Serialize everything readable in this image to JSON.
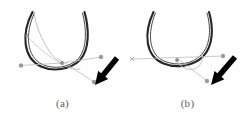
{
  "figure": {
    "background_color": "#fefefe",
    "panel_count": 2,
    "panels": [
      {
        "id": "a",
        "caption": "(a)",
        "curve_color": "#262626",
        "guide_color": "#b4b4b4",
        "arrow_color": "#000000",
        "marker_color": "#8c8c8c",
        "description": "U-shaped dark curve with crossing guide lines and a black annotation arrow pointing to a node marker"
      },
      {
        "id": "b",
        "caption": "(b)",
        "curve_color": "#262626",
        "guide_color": "#b4b4b4",
        "arrow_color": "#000000",
        "marker_color": "#8c8c8c",
        "description": "U-shaped dark curve with a horizontal guide line and a black annotation arrow pointing to a node marker"
      }
    ]
  },
  "chart_data": {
    "type": "line",
    "title": "",
    "xlabel": "",
    "ylabel": "",
    "grid": false,
    "legend": null,
    "xlim": [
      0,
      125
    ],
    "ylim": [
      0,
      100
    ],
    "panels": [
      {
        "name": "(a)",
        "series": [
          {
            "name": "u-curve-outer",
            "role": "dark-u-curve",
            "color": "#262626",
            "width": 2.1,
            "path": "M 32.5 12 C 21 34, 23 58, 41 66.5 C 53 72, 70 70, 80 60 C 90 49.5, 89 28, 84.5 12"
          },
          {
            "name": "u-curve-inner-highlight",
            "role": "dark-u-curve-inner",
            "color": "#4a4a4a",
            "width": 1.0,
            "path": "M 34.5 13 C 24.5 34, 26.5 57, 42.5 64.5 C 54 69.5, 69 68, 78.5 58.5 C 87.5 48.5, 86.5 28, 82.5 13"
          },
          {
            "name": "guide-arc",
            "role": "light-guide-arc",
            "color": "#b9b9b9",
            "width": 0.9,
            "path": "M 34 12 C 36 30, 48 55, 62 64 C 70 69, 76 70, 80 69"
          },
          {
            "name": "guide-arc-2",
            "role": "light-guide-arc",
            "color": "#c4c4c4",
            "width": 0.8,
            "path": "M 27 36 C 36 46, 50 58, 62 64"
          },
          {
            "name": "guide-line-left",
            "role": "light-guide-line",
            "color": "#bdbdbd",
            "width": 0.8,
            "x": [
              21,
              62
            ],
            "y": [
              65.5,
              63
            ]
          },
          {
            "name": "guide-line-right",
            "role": "light-guide-line",
            "color": "#bdbdbd",
            "width": 0.8,
            "x": [
              62,
              101
            ],
            "y": [
              63,
              57
            ]
          },
          {
            "name": "guide-line-diagonal",
            "role": "light-guide-line",
            "color": "#bdbdbd",
            "width": 0.8,
            "x": [
              57,
              94
            ],
            "y": [
              58,
              82
            ]
          }
        ],
        "markers": [
          {
            "name": "node-left",
            "x": 21,
            "y": 65.5,
            "r": 1.9,
            "color": "#9a9a9a"
          },
          {
            "name": "node-center",
            "x": 62,
            "y": 63,
            "r": 1.7,
            "color": "#8f8f8f"
          },
          {
            "name": "node-right",
            "x": 101,
            "y": 57,
            "r": 1.9,
            "color": "#9a9a9a"
          },
          {
            "name": "node-target",
            "x": 94,
            "y": 82,
            "r": 1.9,
            "color": "#9a9a9a"
          },
          {
            "name": "node-upper-left",
            "x": 27,
            "y": 36,
            "r": 1.5,
            "color": "#a6a6a6"
          }
        ],
        "annotation_arrow": {
          "name": "annotation-arrow",
          "color": "#000000",
          "tail_x": 117,
          "tail_y": 58,
          "tip_x": 95,
          "tip_y": 85,
          "shaft_width": 5.5,
          "head_length": 13,
          "head_width": 13
        }
      },
      {
        "name": "(b)",
        "series": [
          {
            "name": "u-curve-outer",
            "role": "dark-u-curve",
            "color": "#262626",
            "width": 2.1,
            "path": "M 28.5 12 C 18.5 33, 20 56, 38.5 63.5 C 51 68.5, 68 66.5, 78 56.5 C 88.5 46, 88.5 27, 84 12"
          },
          {
            "name": "u-curve-inner-highlight",
            "role": "dark-u-curve-inner",
            "color": "#4a4a4a",
            "width": 1.0,
            "path": "M 30.5 13 C 22 33, 23.5 55, 40 61.5 C 52 66, 67 64.5, 76 55 C 86 45, 86 27, 82 13"
          },
          {
            "name": "guide-loop",
            "role": "light-guide-arc",
            "color": "#bdbdbd",
            "width": 0.9,
            "path": "M 52 62 C 58 70, 68 72, 74 66 C 78 62, 78 56, 76 52"
          },
          {
            "name": "guide-line-horizontal",
            "role": "light-guide-line",
            "color": "#bdbdbd",
            "width": 0.8,
            "x": [
              7,
              98
            ],
            "y": [
              59,
              56
            ]
          },
          {
            "name": "guide-line-diagonal",
            "role": "light-guide-line",
            "color": "#bdbdbd",
            "width": 0.8,
            "x": [
              52,
              82
            ],
            "y": [
              58,
              81
            ]
          }
        ],
        "markers": [
          {
            "name": "node-left-cross",
            "x": 7,
            "y": 59,
            "r": 2.0,
            "color": "#9a9a9a",
            "shape": "x"
          },
          {
            "name": "node-center",
            "x": 52,
            "y": 60,
            "r": 1.7,
            "color": "#8f8f8f"
          },
          {
            "name": "node-right",
            "x": 98,
            "y": 56,
            "r": 1.9,
            "color": "#9a9a9a"
          },
          {
            "name": "node-target",
            "x": 82,
            "y": 81,
            "r": 1.9,
            "color": "#9a9a9a"
          }
        ],
        "annotation_arrow": {
          "name": "annotation-arrow",
          "color": "#000000",
          "tail_x": 110,
          "tail_y": 57,
          "tip_x": 86,
          "tip_y": 85,
          "shaft_width": 5.5,
          "head_length": 13,
          "head_width": 13
        }
      }
    ]
  }
}
